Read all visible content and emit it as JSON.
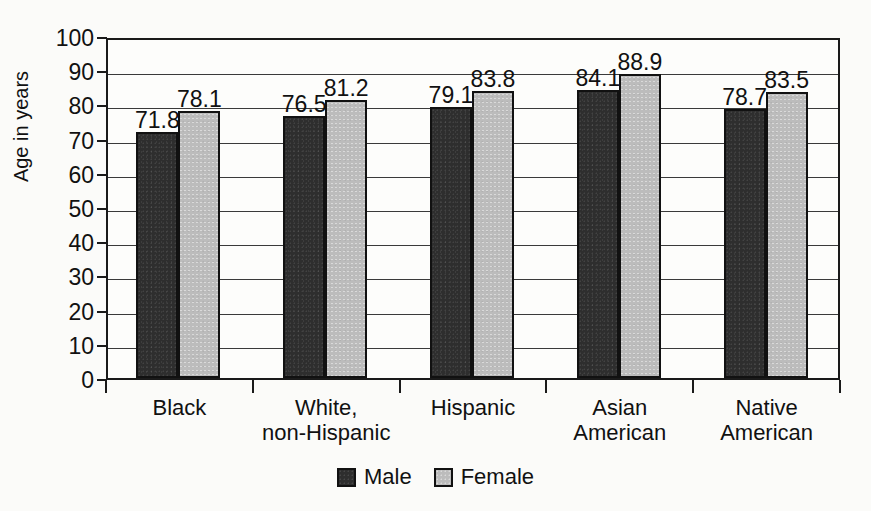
{
  "chart_data": {
    "type": "bar",
    "title": "",
    "xlabel": "",
    "ylabel": "Age in years",
    "ylim": [
      0,
      100
    ],
    "ytick_step": 10,
    "yticks": [
      "100",
      "90",
      "80",
      "70",
      "60",
      "50",
      "40",
      "30",
      "20",
      "10",
      "0"
    ],
    "grid": true,
    "legend_position": "bottom-center",
    "categories": [
      "Black",
      "White, non-Hispanic",
      "Hispanic",
      "Asian American",
      "Native American"
    ],
    "category_lines": [
      [
        "Black"
      ],
      [
        "White,",
        "non-Hispanic"
      ],
      [
        "Hispanic"
      ],
      [
        "Asian",
        "American"
      ],
      [
        "Native",
        "American"
      ]
    ],
    "series": [
      {
        "name": "Male",
        "color": "#2e2e2e",
        "values": [
          71.8,
          76.5,
          79.1,
          84.1,
          78.7
        ],
        "labels": [
          "71.8",
          "76.5",
          "79.1",
          "84.1",
          "78.7"
        ]
      },
      {
        "name": "Female",
        "color": "#bcbcbc",
        "values": [
          78.1,
          81.2,
          83.8,
          88.9,
          83.5
        ],
        "labels": [
          "78.1",
          "81.2",
          "83.8",
          "88.9",
          "83.5"
        ]
      }
    ]
  },
  "legend": {
    "entries": [
      {
        "label": "Male",
        "swatch": "male-swatch"
      },
      {
        "label": "Female",
        "swatch": "female-swatch"
      }
    ]
  },
  "axis": {
    "y_title": "Age in years"
  },
  "colors": {
    "male_bar": "#2e2e2e",
    "female_bar": "#bcbcbc",
    "axis_line": "#1a1a1a",
    "gridline": "#3a3a3a",
    "text": "#111111",
    "background": "#fbfbf9"
  }
}
